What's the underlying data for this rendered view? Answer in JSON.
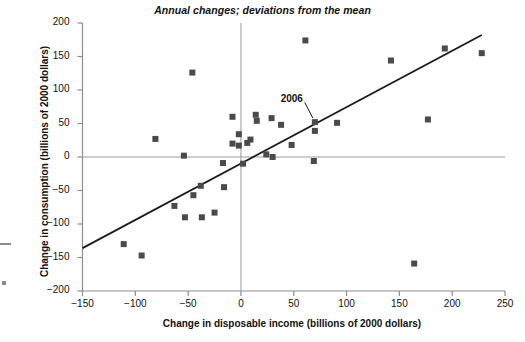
{
  "chart_data": {
    "type": "scatter",
    "title": "Annual changes; deviations from the mean",
    "xlabel": "Change in disposable income (billions of 2000 dollars)",
    "ylabel": "Change in consumption (billions of 2000 dollars)",
    "xlim": [
      -150,
      250
    ],
    "ylim": [
      -200,
      200
    ],
    "xticks": [
      -150,
      -100,
      -50,
      0,
      50,
      100,
      150,
      200,
      250
    ],
    "yticks": [
      -200,
      -150,
      -100,
      -50,
      0,
      50,
      100,
      150,
      200
    ],
    "xtick_labels": [
      "−150",
      "−100",
      "−50",
      "0",
      "50",
      "100",
      "150",
      "200",
      "250"
    ],
    "ytick_labels": [
      "−200",
      "−150",
      "−100",
      "−50",
      "0",
      "50",
      "100",
      "150",
      "200"
    ],
    "grid": false,
    "legend": null,
    "marker": {
      "shape": "square",
      "color": "#4a4a4a",
      "size": 6
    },
    "reference_lines": [
      {
        "name": "x-zero-line",
        "orientation": "vertical",
        "value": 0,
        "color": "#9a9a9a"
      },
      {
        "name": "y-zero-line",
        "orientation": "horizontal",
        "value": 0,
        "color": "#9a9a9a"
      }
    ],
    "trendline": {
      "name": "regression-line",
      "color": "#1a1a1a",
      "x_start": -150,
      "y_start": -136,
      "x_end": 228,
      "y_end": 182
    },
    "annotations": [
      {
        "label": "2006",
        "label_x": 49,
        "label_y": 86,
        "point_x": 70,
        "point_y": 52
      }
    ],
    "points": [
      {
        "x": -111,
        "y": -130
      },
      {
        "x": -94,
        "y": -147
      },
      {
        "x": -81,
        "y": 27
      },
      {
        "x": -63,
        "y": -73
      },
      {
        "x": -54,
        "y": 2
      },
      {
        "x": -53,
        "y": -90
      },
      {
        "x": -46,
        "y": 126
      },
      {
        "x": -45,
        "y": -57
      },
      {
        "x": -38,
        "y": -43
      },
      {
        "x": -37,
        "y": -90
      },
      {
        "x": -25,
        "y": -83
      },
      {
        "x": -17,
        "y": -9
      },
      {
        "x": -16,
        "y": -45
      },
      {
        "x": -8,
        "y": 60
      },
      {
        "x": -8,
        "y": 20
      },
      {
        "x": -2,
        "y": 34
      },
      {
        "x": -2,
        "y": 17
      },
      {
        "x": 2,
        "y": -10
      },
      {
        "x": 6,
        "y": 21
      },
      {
        "x": 9,
        "y": 26
      },
      {
        "x": 14,
        "y": 63
      },
      {
        "x": 15,
        "y": 54
      },
      {
        "x": 24,
        "y": 4
      },
      {
        "x": 29,
        "y": 58
      },
      {
        "x": 30,
        "y": 0
      },
      {
        "x": 38,
        "y": 48
      },
      {
        "x": 48,
        "y": 18
      },
      {
        "x": 61,
        "y": 174
      },
      {
        "x": 69,
        "y": -6
      },
      {
        "x": 70,
        "y": 52
      },
      {
        "x": 70,
        "y": 39
      },
      {
        "x": 91,
        "y": 51
      },
      {
        "x": 142,
        "y": 144
      },
      {
        "x": 164,
        "y": -159
      },
      {
        "x": 177,
        "y": 56
      },
      {
        "x": 193,
        "y": 162
      },
      {
        "x": 228,
        "y": 155
      }
    ]
  }
}
